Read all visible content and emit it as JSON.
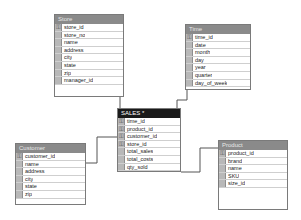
{
  "diagram": {
    "tables": {
      "store": {
        "title": "Store",
        "columns": [
          {
            "name": "store_id",
            "key": true
          },
          {
            "name": "store_no",
            "key": false
          },
          {
            "name": "name",
            "key": false
          },
          {
            "name": "address",
            "key": false
          },
          {
            "name": "city",
            "key": false
          },
          {
            "name": "state",
            "key": false
          },
          {
            "name": "zip",
            "key": false
          },
          {
            "name": "manager_id",
            "key": false
          }
        ]
      },
      "time": {
        "title": "Time",
        "columns": [
          {
            "name": "time_id",
            "key": true
          },
          {
            "name": "date",
            "key": false
          },
          {
            "name": "month",
            "key": false
          },
          {
            "name": "day",
            "key": false
          },
          {
            "name": "year",
            "key": false
          },
          {
            "name": "quarter",
            "key": false
          },
          {
            "name": "day_of_week",
            "key": false
          }
        ]
      },
      "sales": {
        "title": "SALES *",
        "columns": [
          {
            "name": "time_id",
            "key": true
          },
          {
            "name": "product_id",
            "key": true
          },
          {
            "name": "customer_id",
            "key": true
          },
          {
            "name": "store_id",
            "key": true
          },
          {
            "name": "total_sales",
            "key": false
          },
          {
            "name": "total_costs",
            "key": false
          },
          {
            "name": "qty_sold",
            "key": false
          }
        ]
      },
      "customer": {
        "title": "Customer",
        "columns": [
          {
            "name": "customer_id",
            "key": true
          },
          {
            "name": "name",
            "key": false
          },
          {
            "name": "address",
            "key": false
          },
          {
            "name": "city",
            "key": false
          },
          {
            "name": "state",
            "key": false
          },
          {
            "name": "zip",
            "key": false
          }
        ]
      },
      "product": {
        "title": "Product",
        "columns": [
          {
            "name": "product_id",
            "key": true
          },
          {
            "name": "brand",
            "key": false
          },
          {
            "name": "name",
            "key": false
          },
          {
            "name": "SKU",
            "key": false
          },
          {
            "name": "size_id",
            "key": false
          }
        ]
      }
    },
    "key_glyph": "⚿",
    "colors": {
      "title_bar": "#8a8a8a",
      "selected_title_bar": "#1a1a1a",
      "line": "#555555"
    }
  }
}
